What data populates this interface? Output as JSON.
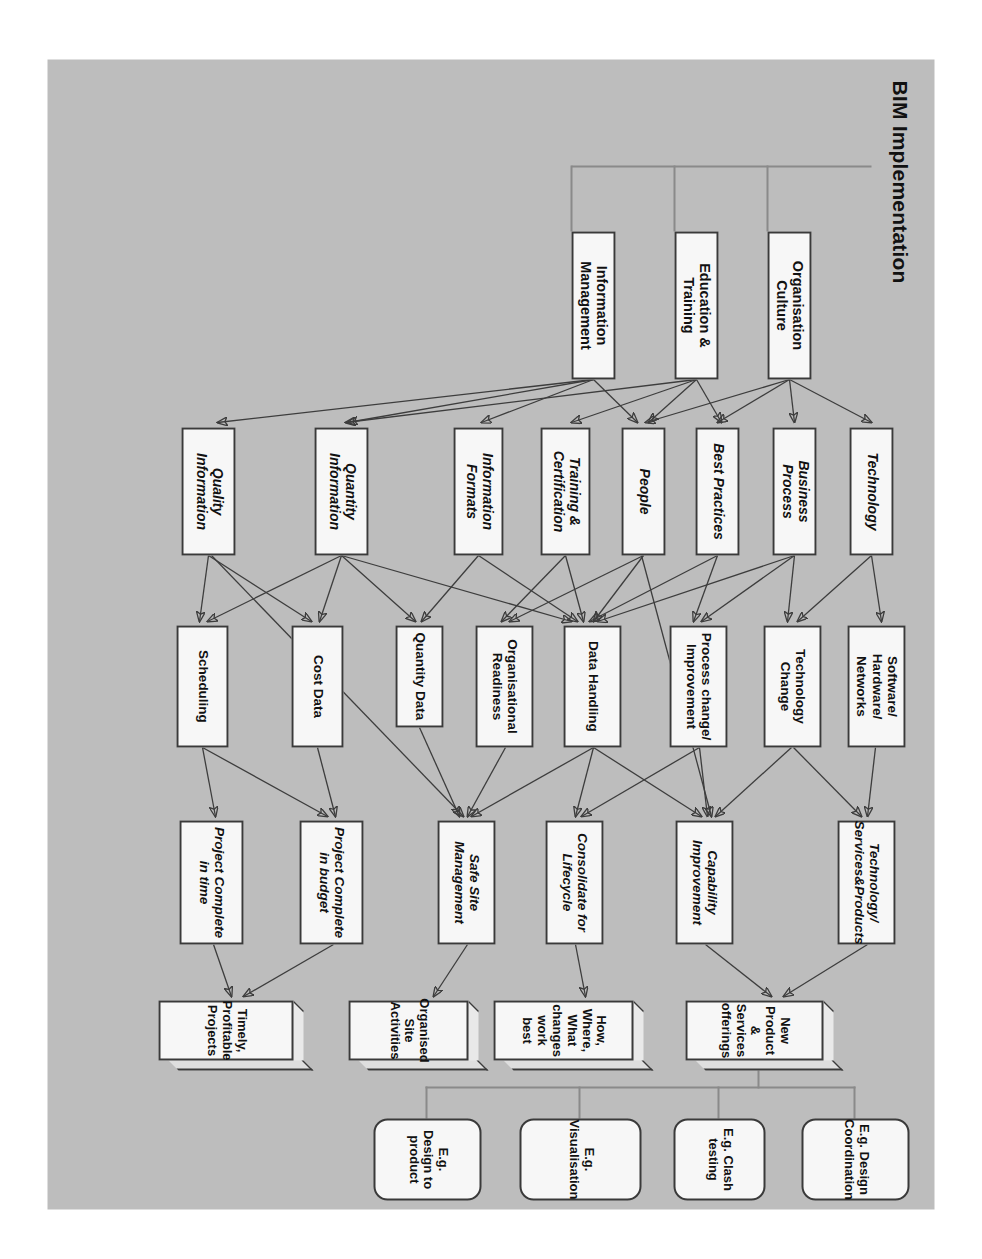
{
  "figure": {
    "title": "BIM Implementation",
    "background_color": "#bdbdbd",
    "node_fill": "#f7f7f7",
    "node_border": "#3a3a3a",
    "orientation": "rotated-90"
  },
  "drivers": [
    {
      "id": "org-culture",
      "label": "Organisation Culture"
    },
    {
      "id": "edu-training",
      "label": "Education & Training"
    },
    {
      "id": "info-mgmt",
      "label": "Information Management"
    }
  ],
  "enablers": [
    {
      "id": "technology",
      "label": "Technology"
    },
    {
      "id": "business-process",
      "label": "Business Process"
    },
    {
      "id": "best-practices",
      "label": "Best Practices"
    },
    {
      "id": "people",
      "label": "People"
    },
    {
      "id": "training-cert",
      "label": "Training & Certification"
    },
    {
      "id": "info-formats",
      "label": "Information Formats"
    },
    {
      "id": "quantity-info",
      "label": "Quantity Information"
    },
    {
      "id": "quality-info",
      "label": "Quality Information"
    }
  ],
  "processes": [
    {
      "id": "software-hardware-networks",
      "label": "Software/ Hardware/ Networks"
    },
    {
      "id": "technology-change",
      "label": "Technology Change"
    },
    {
      "id": "process-change",
      "label": "Process change/ Improvement"
    },
    {
      "id": "data-handling",
      "label": "Data Handling"
    },
    {
      "id": "organisational-readiness",
      "label": "Organisational Readiness"
    },
    {
      "id": "cost-data",
      "label": "Cost Data"
    },
    {
      "id": "scheduling",
      "label": "Scheduling"
    },
    {
      "id": "quantity-data",
      "label": "Quantity Data"
    }
  ],
  "outcomes": [
    {
      "id": "technology-services-products",
      "label": "Technology/ Services&Products"
    },
    {
      "id": "capability-improvement",
      "label": "Capability Improvement"
    },
    {
      "id": "consolidate-lifecycle",
      "label": "Consolidate for Lifecycle"
    },
    {
      "id": "safe-site-management",
      "label": "Safe Site Management"
    },
    {
      "id": "project-complete-budget",
      "label": "Project Complete in budget"
    },
    {
      "id": "project-complete-time",
      "label": "Project Complete in time"
    }
  ],
  "benefits": [
    {
      "id": "new-product-services",
      "label": "New Product & Services offerings"
    },
    {
      "id": "how-where-what",
      "label": "How, Where, What changes work best"
    },
    {
      "id": "organised-site",
      "label": "Organised Site Activities"
    },
    {
      "id": "timely-profitable",
      "label": "Timely, Profitable Projects"
    }
  ],
  "examples": [
    {
      "id": "eg-design-coordination",
      "label": "E.g. Design Coordination"
    },
    {
      "id": "eg-clash-testing",
      "label": "E.g. Clash testing"
    },
    {
      "id": "eg-visualisation",
      "label": "E.g. Visualisation"
    },
    {
      "id": "eg-design-to-product",
      "label": "E.g. Design to product"
    }
  ],
  "caption": ""
}
